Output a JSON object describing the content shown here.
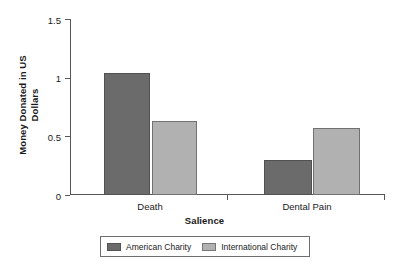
{
  "chart_data": {
    "type": "bar",
    "title": "",
    "xlabel": "Salience",
    "ylabel": "Money Donated in US Dollars",
    "categories": [
      "Death",
      "Dental Pain"
    ],
    "series": [
      {
        "name": "American Charity",
        "color": "#6b6b6b",
        "values": [
          1.04,
          0.3
        ]
      },
      {
        "name": "International Charity",
        "color": "#b1b1b1",
        "values": [
          0.63,
          0.57
        ]
      }
    ],
    "ylim": [
      0,
      1.5
    ],
    "yticks": [
      "0",
      "0.5",
      "1",
      "1.5"
    ],
    "ytick_values": [
      0,
      0.5,
      1,
      1.5
    ],
    "grid": false,
    "legend_position": "bottom"
  },
  "axis": {
    "y_title_line1": "Money Donated in US",
    "y_title_line2": "Dollars",
    "y_tick_0": "0",
    "y_tick_1": "0.5",
    "y_tick_2": "1",
    "y_tick_3": "1.5",
    "x_title": "Salience",
    "x_cat_0": "Death",
    "x_cat_1": "Dental Pain"
  },
  "legend": {
    "item_0": "American Charity",
    "item_1": "International Charity"
  },
  "colors": {
    "american": "#6b6b6b",
    "international": "#b1b1b1",
    "axis": "#585858",
    "legend_border": "#6e6e6e"
  }
}
